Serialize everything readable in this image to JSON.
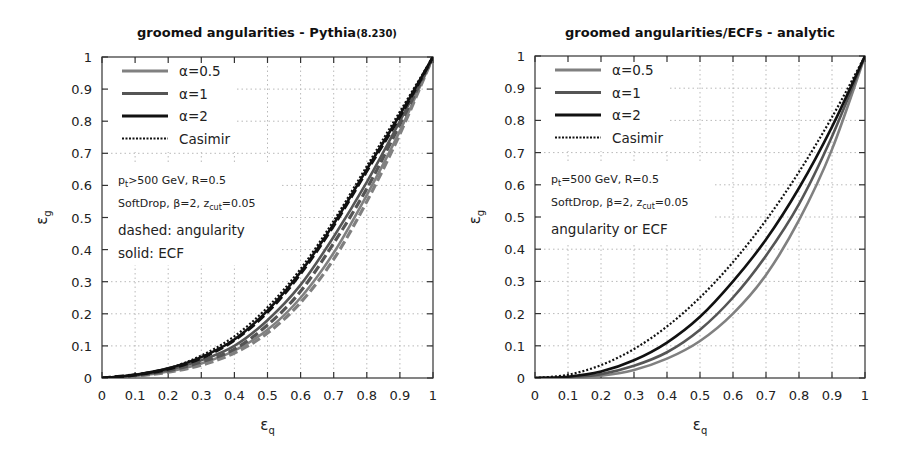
{
  "chart_data": [
    {
      "type": "line",
      "title": "groomed angularities - Pythia",
      "title_suffix": "(8.230)",
      "xlabel": "ε_q",
      "ylabel": "ε_g",
      "xlim": [
        0,
        1
      ],
      "ylim": [
        0,
        1
      ],
      "grid": true,
      "legend_position": "upper-left",
      "xticks": [
        "0",
        "0.1",
        "0.2",
        "0.3",
        "0.4",
        "0.5",
        "0.6",
        "0.7",
        "0.8",
        "0.9",
        "1"
      ],
      "yticks": [
        "0",
        "0.1",
        "0.2",
        "0.3",
        "0.4",
        "0.5",
        "0.6",
        "0.7",
        "0.8",
        "0.9",
        "1"
      ],
      "legend": [
        {
          "label": "α=0.5",
          "style": "solid",
          "color": "#808080",
          "width": 3
        },
        {
          "label": "α=1",
          "style": "solid",
          "color": "#555555",
          "width": 3
        },
        {
          "label": "α=2",
          "style": "solid",
          "color": "#111111",
          "width": 3
        },
        {
          "label": "Casimir",
          "style": "dotted",
          "color": "#111111",
          "width": 2
        }
      ],
      "annotations": [
        "p_t>500 GeV, R=0.5",
        "SoftDrop, β=2, z_cut=0.05",
        "dashed: angularity",
        "solid: ECF"
      ],
      "x": [
        0,
        0.1,
        0.2,
        0.3,
        0.4,
        0.5,
        0.6,
        0.7,
        0.8,
        0.9,
        1.0
      ],
      "series": [
        {
          "name": "Casimir",
          "style": "dotted",
          "values": [
            0,
            0.01,
            0.03,
            0.07,
            0.13,
            0.22,
            0.34,
            0.49,
            0.66,
            0.83,
            1.0
          ]
        },
        {
          "name": "α=2 ECF",
          "style": "solid",
          "values": [
            0,
            0.01,
            0.03,
            0.065,
            0.12,
            0.21,
            0.33,
            0.48,
            0.65,
            0.82,
            1.0
          ]
        },
        {
          "name": "α=2 angularity",
          "style": "dashed",
          "values": [
            0,
            0.01,
            0.028,
            0.062,
            0.118,
            0.205,
            0.325,
            0.475,
            0.645,
            0.815,
            1.0
          ]
        },
        {
          "name": "α=1 ECF",
          "style": "solid",
          "values": [
            0,
            0.008,
            0.025,
            0.055,
            0.1,
            0.18,
            0.29,
            0.44,
            0.61,
            0.8,
            1.0
          ]
        },
        {
          "name": "α=1 angularity",
          "style": "dashed",
          "values": [
            0,
            0.008,
            0.023,
            0.05,
            0.09,
            0.165,
            0.27,
            0.42,
            0.59,
            0.79,
            1.0
          ]
        },
        {
          "name": "α=0.5 ECF",
          "style": "solid",
          "values": [
            0,
            0.006,
            0.02,
            0.045,
            0.085,
            0.15,
            0.25,
            0.39,
            0.57,
            0.77,
            1.0
          ]
        },
        {
          "name": "α=0.5 angularity",
          "style": "dashed",
          "values": [
            0,
            0.006,
            0.018,
            0.04,
            0.078,
            0.14,
            0.235,
            0.37,
            0.55,
            0.76,
            1.0
          ]
        }
      ]
    },
    {
      "type": "line",
      "title": "groomed angularities/ECFs - analytic",
      "xlabel": "ε_q",
      "ylabel": "ε_g",
      "xlim": [
        0,
        1
      ],
      "ylim": [
        0,
        1
      ],
      "grid": true,
      "legend_position": "upper-left",
      "xticks": [
        "0",
        "0.1",
        "0.2",
        "0.3",
        "0.4",
        "0.5",
        "0.6",
        "0.7",
        "0.8",
        "0.9",
        "1"
      ],
      "yticks": [
        "0",
        "0.1",
        "0.2",
        "0.3",
        "0.4",
        "0.5",
        "0.6",
        "0.7",
        "0.8",
        "0.9",
        "1"
      ],
      "legend": [
        {
          "label": "α=0.5",
          "style": "solid",
          "color": "#808080",
          "width": 3
        },
        {
          "label": "α=1",
          "style": "solid",
          "color": "#555555",
          "width": 3
        },
        {
          "label": "α=2",
          "style": "solid",
          "color": "#111111",
          "width": 3
        },
        {
          "label": "Casimir",
          "style": "dotted",
          "color": "#111111",
          "width": 2
        }
      ],
      "annotations": [
        "p_t=500 GeV, R=0.5",
        "SoftDrop, β=2, z_cut=0.05",
        "angularity or ECF"
      ],
      "x": [
        0,
        0.1,
        0.2,
        0.3,
        0.4,
        0.5,
        0.6,
        0.7,
        0.8,
        0.9,
        1.0
      ],
      "series": [
        {
          "name": "Casimir",
          "style": "dotted",
          "values": [
            0,
            0.01,
            0.04,
            0.09,
            0.16,
            0.25,
            0.36,
            0.49,
            0.64,
            0.81,
            1.0
          ]
        },
        {
          "name": "α=2",
          "style": "solid",
          "values": [
            0,
            0.004,
            0.02,
            0.055,
            0.11,
            0.19,
            0.3,
            0.43,
            0.59,
            0.78,
            1.0
          ]
        },
        {
          "name": "α=1",
          "style": "solid",
          "values": [
            0,
            0.002,
            0.012,
            0.038,
            0.08,
            0.15,
            0.25,
            0.38,
            0.54,
            0.75,
            1.0
          ]
        },
        {
          "name": "α=0.5",
          "style": "solid",
          "values": [
            0,
            0.001,
            0.007,
            0.025,
            0.06,
            0.115,
            0.2,
            0.32,
            0.49,
            0.71,
            1.0
          ]
        }
      ]
    }
  ]
}
